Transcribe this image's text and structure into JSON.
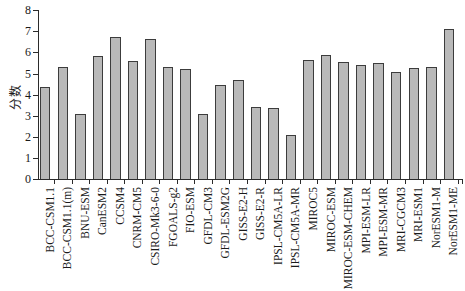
{
  "chart_data": {
    "type": "bar",
    "title": "",
    "xlabel": "",
    "ylabel": "分数",
    "ylim": [
      0,
      8
    ],
    "ytick_step": 1,
    "ytick_labels": [
      "0",
      "1",
      "2",
      "3",
      "4",
      "5",
      "6",
      "7",
      "8"
    ],
    "grid": false,
    "legend": "none",
    "bar_fill_color": "#b9b9b9",
    "bar_border_color": "#3c3c3c",
    "axis_color": "#2b2b2b",
    "categories": [
      "BCC-CSM1.1",
      "BCC-CSM1.1(m)",
      "BNU-ESM",
      "CanESM2",
      "CCSM4",
      "CNRM-CM5",
      "CSIRO-Mk3-6-0",
      "FGOALS-g2",
      "FIO-ESM",
      "GFDL-CM3",
      "GFDL-ESM2G",
      "GISS-E2-H",
      "GISS-E2-R",
      "IPSL-CM5A-LR",
      "IPSL-CM5A-MR",
      "MIROC5",
      "MIROC-ESM",
      "MIROC-ESM-CHEM",
      "MPI-ESM-LR",
      "MPI-ESM-MR",
      "MRI-CGCM3",
      "MRI-ESM1",
      "NorESM1-M",
      "NorESM1-ME"
    ],
    "values": [
      4.35,
      5.3,
      3.1,
      5.85,
      6.75,
      5.6,
      6.65,
      5.3,
      5.2,
      3.1,
      4.45,
      4.7,
      3.4,
      3.35,
      2.1,
      5.65,
      5.9,
      5.55,
      5.4,
      5.5,
      5.05,
      5.25,
      5.3,
      7.1
    ]
  }
}
